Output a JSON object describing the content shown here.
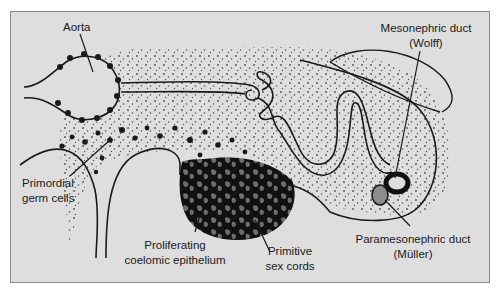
{
  "diagram": {
    "type": "anatomical cross-section (embryonic urogenital ridge)",
    "colors": {
      "background": "#dedede",
      "frame": "#8a8a8a",
      "ink": "#1a1a1a",
      "epithelium_fill": "#111111",
      "sex_cords_fill": "#6e6e6e",
      "mullerian_duct_fill": "#8c8c8c"
    },
    "labels": {
      "aorta": "Aorta",
      "mesonephric_line1": "Mesonephric duct",
      "mesonephric_line2": "(Wolff)",
      "primordial_line1": "Primordial",
      "primordial_line2": "germ cells",
      "proliferating_line1": "Proliferating",
      "proliferating_line2": "coelomic epithelium",
      "primitive_line1": "Primitive",
      "primitive_line2": "sex cords",
      "paramesonephric_line1": "Paramesonephric duct",
      "paramesonephric_line2": "(Müller)"
    }
  }
}
